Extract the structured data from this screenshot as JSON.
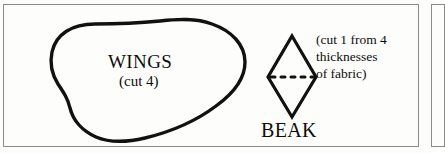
{
  "document": {
    "type": "sewing-pattern-sheet",
    "background_color": "#fdfdfb",
    "ink_color": "#0d0d0d",
    "border_color": "#8a8a8a"
  },
  "pieces": {
    "wings": {
      "name": "WINGS",
      "cut_instruction": "(cut 4)",
      "shape": "freeform-blob-outline"
    },
    "beak": {
      "name": "BEAK",
      "shape": "diamond-outline",
      "fold_line": "horizontal-dashed-line",
      "note_lines": [
        "(cut 1 from 4",
        "thicknesses",
        "of fabric)"
      ]
    }
  }
}
